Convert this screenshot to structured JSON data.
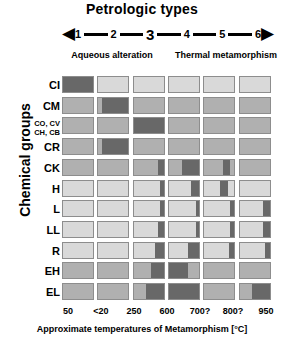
{
  "header": {
    "title": "Petrologic types",
    "left_arrow": "◀",
    "right_arrow": "▶",
    "petrologic_types": [
      "1",
      "2",
      "3",
      "4",
      "5",
      "6"
    ],
    "emphasized_type": "3",
    "process_left": "Aqueous alteration",
    "process_right": "Thermal metamorphism"
  },
  "axes": {
    "ylabel": "Chemical groups",
    "xlabel": "Approximate temperatures of Metamorphism [°C]",
    "xticks": [
      "50",
      "<20",
      "250",
      "600",
      "700?",
      "800?",
      "950"
    ]
  },
  "colors": {
    "dark": "#686868",
    "medium": "#b0b0b0",
    "light": "#d9d9d9",
    "border": "#8d8d8d",
    "background": "#ffffff",
    "ink": "#000000"
  },
  "chart_data": {
    "type": "heatmap",
    "title": "Petrologic types",
    "xlabel": "Approximate temperatures of Metamorphism [°C]",
    "ylabel": "Chemical groups",
    "categories": [
      "1",
      "2",
      "3",
      "4",
      "5",
      "6"
    ],
    "xtick_labels": [
      "50",
      "<20",
      "250",
      "600",
      "700?",
      "800?",
      "950"
    ],
    "rows": [
      "CI",
      "CO, CV\nCH, CB",
      "CM",
      "CR",
      "CK",
      "H",
      "L",
      "LL",
      "R",
      "EH",
      "EL"
    ],
    "row_labels": [
      {
        "text": "CI",
        "lines": [
          "CI"
        ]
      },
      {
        "text": "CM",
        "lines": [
          "CM"
        ]
      },
      {
        "text": "CO, CV CH, CB",
        "lines": [
          "CO, CV",
          "CH, CB"
        ]
      },
      {
        "text": "CR",
        "lines": [
          "CR"
        ]
      },
      {
        "text": "CK",
        "lines": [
          "CK"
        ]
      },
      {
        "text": "H",
        "lines": [
          "H"
        ]
      },
      {
        "text": "L",
        "lines": [
          "L"
        ]
      },
      {
        "text": "LL",
        "lines": [
          "LL"
        ]
      },
      {
        "text": "R",
        "lines": [
          "R"
        ]
      },
      {
        "text": "EH",
        "lines": [
          "EH"
        ]
      },
      {
        "text": "EL",
        "lines": [
          "EL"
        ]
      }
    ],
    "legend": [
      "dark = occupied petrologic type",
      "light = not observed"
    ],
    "grid": true,
    "cells": [
      {
        "row": "CI",
        "base": "light",
        "fills": [
          {
            "col": 1,
            "start": 0.0,
            "end": 1.0
          }
        ]
      },
      {
        "row": "CM",
        "base": "medium",
        "fills": [
          {
            "col": 2,
            "start": 0.12,
            "end": 1.0
          }
        ]
      },
      {
        "row": "CO, CV CH, CB",
        "base": "medium",
        "fills": [
          {
            "col": 3,
            "start": 0.0,
            "end": 1.0
          }
        ]
      },
      {
        "row": "CR",
        "base": "medium",
        "fills": [
          {
            "col": 2,
            "start": 0.12,
            "end": 1.0
          }
        ]
      },
      {
        "row": "CK",
        "base": "medium",
        "fills": [
          {
            "col": 3,
            "start": 0.82,
            "end": 1.0
          },
          {
            "col": 4,
            "start": 0.42,
            "end": 1.0
          },
          {
            "col": 5,
            "start": 0.62,
            "end": 0.84
          }
        ]
      },
      {
        "row": "H",
        "base": "light",
        "fills": [
          {
            "col": 3,
            "start": 0.86,
            "end": 1.0
          },
          {
            "col": 4,
            "start": 0.72,
            "end": 1.0
          },
          {
            "col": 5,
            "start": 0.52,
            "end": 0.8
          }
        ]
      },
      {
        "row": "L",
        "base": "light",
        "fills": [
          {
            "col": 3,
            "start": 0.86,
            "end": 1.0
          },
          {
            "col": 4,
            "start": 0.9,
            "end": 1.0
          },
          {
            "col": 5,
            "start": 0.84,
            "end": 1.0
          },
          {
            "col": 6,
            "start": 0.78,
            "end": 1.0
          }
        ]
      },
      {
        "row": "LL",
        "base": "light",
        "fills": [
          {
            "col": 3,
            "start": 0.8,
            "end": 1.0
          },
          {
            "col": 4,
            "start": 0.9,
            "end": 1.0
          },
          {
            "col": 5,
            "start": 0.86,
            "end": 1.0
          },
          {
            "col": 6,
            "start": 0.76,
            "end": 1.0
          }
        ]
      },
      {
        "row": "R",
        "base": "light",
        "fills": [
          {
            "col": 3,
            "start": 0.7,
            "end": 1.0
          },
          {
            "col": 4,
            "start": 0.62,
            "end": 1.0
          },
          {
            "col": 5,
            "start": 0.82,
            "end": 1.0
          },
          {
            "col": 6,
            "start": 0.84,
            "end": 1.0
          }
        ]
      },
      {
        "row": "EH",
        "base": "medium",
        "fills": [
          {
            "col": 3,
            "start": 0.58,
            "end": 1.0
          },
          {
            "col": 4,
            "start": 0.0,
            "end": 0.62
          }
        ]
      },
      {
        "row": "EL",
        "base": "medium",
        "fills": [
          {
            "col": 3,
            "start": 0.4,
            "end": 1.0
          },
          {
            "col": 4,
            "start": 0.0,
            "end": 1.0
          },
          {
            "col": 6,
            "start": 0.4,
            "end": 1.0
          }
        ]
      }
    ]
  }
}
